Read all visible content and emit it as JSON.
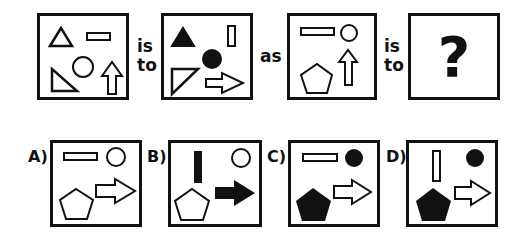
{
  "puzzle": {
    "connectors": {
      "is_to_1": [
        "is",
        "to"
      ],
      "as": "as",
      "is_to_2": [
        "is",
        "to"
      ]
    },
    "question_mark": "?",
    "options": [
      {
        "label": "A)"
      },
      {
        "label": "B)"
      },
      {
        "label": "C)"
      },
      {
        "label": "D)"
      }
    ],
    "colors": {
      "stroke": "#111111",
      "fill_solid": "#111111",
      "fill_hollow": "#ffffff"
    }
  }
}
